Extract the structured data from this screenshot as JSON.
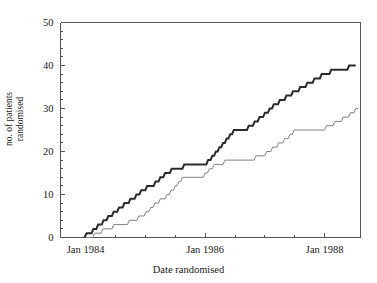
{
  "chart_data": {
    "type": "line",
    "subtype": "step-post cumulative recruitment",
    "title": "",
    "xlabel": "Date randomised",
    "ylabel": "no. of patients randomised",
    "ylabel_lines": [
      "no. of patients",
      "randomised"
    ],
    "grid": false,
    "legend": "none",
    "background": "#ffffff",
    "axis_color": "#555555",
    "xlim": [
      1983.58,
      1988.6
    ],
    "ylim": [
      0,
      50
    ],
    "yticks": [
      0,
      10,
      20,
      30,
      40,
      50
    ],
    "ytick_labels": [
      "0",
      "10",
      "20",
      "30",
      "40",
      "50"
    ],
    "y_minor_step": 2,
    "xticks": [
      1984.0,
      1984.5,
      1985.0,
      1985.5,
      1986.0,
      1986.5,
      1987.0,
      1987.5,
      1988.0
    ],
    "xtick_major": [
      1984.0,
      1986.0,
      1988.0
    ],
    "xtick_labels": [
      "Jan 1984",
      "Jan 1986",
      "Jan 1988"
    ],
    "series": [
      {
        "name": "group-a-bold",
        "style": "solid",
        "color": "#2b2b2b",
        "width": 2.0,
        "final_value": 40,
        "points": [
          [
            1983.98,
            0
          ],
          [
            1984.02,
            1
          ],
          [
            1984.1,
            1
          ],
          [
            1984.13,
            2
          ],
          [
            1984.18,
            2
          ],
          [
            1984.21,
            3
          ],
          [
            1984.27,
            3
          ],
          [
            1984.3,
            4
          ],
          [
            1984.35,
            4
          ],
          [
            1984.38,
            5
          ],
          [
            1984.44,
            5
          ],
          [
            1984.47,
            6
          ],
          [
            1984.53,
            6
          ],
          [
            1984.56,
            7
          ],
          [
            1984.62,
            7
          ],
          [
            1984.65,
            8
          ],
          [
            1984.72,
            8
          ],
          [
            1984.75,
            9
          ],
          [
            1984.82,
            9
          ],
          [
            1984.85,
            10
          ],
          [
            1984.9,
            10
          ],
          [
            1984.93,
            11
          ],
          [
            1985.0,
            11
          ],
          [
            1985.03,
            12
          ],
          [
            1985.14,
            12
          ],
          [
            1985.17,
            13
          ],
          [
            1985.22,
            13
          ],
          [
            1985.25,
            14
          ],
          [
            1985.3,
            14
          ],
          [
            1985.33,
            15
          ],
          [
            1985.41,
            15
          ],
          [
            1985.44,
            16
          ],
          [
            1985.62,
            16
          ],
          [
            1985.65,
            17
          ],
          [
            1986.02,
            17
          ],
          [
            1986.05,
            18
          ],
          [
            1986.09,
            18
          ],
          [
            1986.12,
            19
          ],
          [
            1986.15,
            19
          ],
          [
            1986.18,
            20
          ],
          [
            1986.21,
            20
          ],
          [
            1986.24,
            21
          ],
          [
            1986.27,
            21
          ],
          [
            1986.3,
            22
          ],
          [
            1986.33,
            22
          ],
          [
            1986.36,
            23
          ],
          [
            1986.39,
            23
          ],
          [
            1986.42,
            24
          ],
          [
            1986.45,
            24
          ],
          [
            1986.48,
            25
          ],
          [
            1986.7,
            25
          ],
          [
            1986.73,
            26
          ],
          [
            1986.8,
            26
          ],
          [
            1986.83,
            27
          ],
          [
            1986.88,
            27
          ],
          [
            1986.91,
            28
          ],
          [
            1986.97,
            28
          ],
          [
            1987.0,
            29
          ],
          [
            1987.05,
            29
          ],
          [
            1987.08,
            30
          ],
          [
            1987.12,
            30
          ],
          [
            1987.15,
            31
          ],
          [
            1987.22,
            31
          ],
          [
            1987.25,
            32
          ],
          [
            1987.33,
            32
          ],
          [
            1987.36,
            33
          ],
          [
            1987.44,
            33
          ],
          [
            1987.47,
            34
          ],
          [
            1987.56,
            34
          ],
          [
            1987.59,
            35
          ],
          [
            1987.68,
            35
          ],
          [
            1987.71,
            36
          ],
          [
            1987.8,
            36
          ],
          [
            1987.83,
            37
          ],
          [
            1987.92,
            37
          ],
          [
            1987.95,
            38
          ],
          [
            1988.08,
            38
          ],
          [
            1988.11,
            39
          ],
          [
            1988.38,
            39
          ],
          [
            1988.41,
            40
          ],
          [
            1988.52,
            40
          ]
        ]
      },
      {
        "name": "group-b-thin",
        "style": "solid",
        "color": "#808080",
        "width": 1.0,
        "final_value": 30,
        "points": [
          [
            1984.0,
            0
          ],
          [
            1984.12,
            0
          ],
          [
            1984.15,
            1
          ],
          [
            1984.26,
            1
          ],
          [
            1984.29,
            2
          ],
          [
            1984.44,
            2
          ],
          [
            1984.47,
            3
          ],
          [
            1984.7,
            3
          ],
          [
            1984.73,
            4
          ],
          [
            1984.86,
            4
          ],
          [
            1984.89,
            5
          ],
          [
            1984.98,
            5
          ],
          [
            1985.01,
            6
          ],
          [
            1985.06,
            6
          ],
          [
            1985.09,
            7
          ],
          [
            1985.13,
            7
          ],
          [
            1985.16,
            8
          ],
          [
            1985.22,
            8
          ],
          [
            1985.25,
            9
          ],
          [
            1985.33,
            9
          ],
          [
            1985.36,
            10
          ],
          [
            1985.4,
            10
          ],
          [
            1985.43,
            11
          ],
          [
            1985.47,
            11
          ],
          [
            1985.5,
            12
          ],
          [
            1985.53,
            12
          ],
          [
            1985.56,
            13
          ],
          [
            1985.59,
            13
          ],
          [
            1985.62,
            14
          ],
          [
            1985.97,
            14
          ],
          [
            1986.0,
            15
          ],
          [
            1986.04,
            15
          ],
          [
            1986.07,
            16
          ],
          [
            1986.12,
            16
          ],
          [
            1986.15,
            17
          ],
          [
            1986.3,
            17
          ],
          [
            1986.33,
            18
          ],
          [
            1986.82,
            18
          ],
          [
            1986.85,
            19
          ],
          [
            1987.0,
            19
          ],
          [
            1987.03,
            20
          ],
          [
            1987.1,
            20
          ],
          [
            1987.13,
            21
          ],
          [
            1987.2,
            21
          ],
          [
            1987.23,
            22
          ],
          [
            1987.3,
            22
          ],
          [
            1987.33,
            23
          ],
          [
            1987.39,
            23
          ],
          [
            1987.42,
            24
          ],
          [
            1987.46,
            24
          ],
          [
            1987.49,
            25
          ],
          [
            1988.0,
            25
          ],
          [
            1988.03,
            26
          ],
          [
            1988.14,
            26
          ],
          [
            1988.17,
            27
          ],
          [
            1988.28,
            27
          ],
          [
            1988.31,
            28
          ],
          [
            1988.4,
            28
          ],
          [
            1988.43,
            29
          ],
          [
            1988.49,
            29
          ],
          [
            1988.52,
            30
          ],
          [
            1988.56,
            30
          ]
        ]
      }
    ]
  }
}
